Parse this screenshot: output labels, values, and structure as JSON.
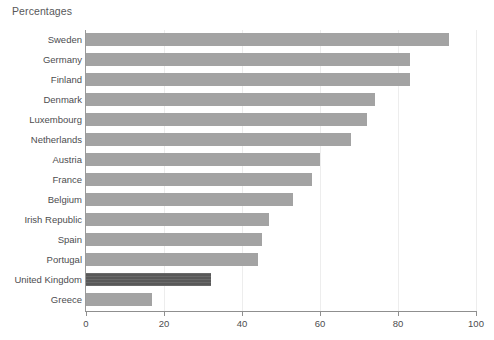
{
  "chart_data": {
    "type": "bar",
    "orientation": "horizontal",
    "title": "Percentages",
    "xlabel": "",
    "ylabel": "",
    "xlim": [
      0,
      100
    ],
    "xticks": [
      0,
      20,
      40,
      60,
      80,
      100
    ],
    "grid": true,
    "legend": null,
    "categories": [
      "Sweden",
      "Germany",
      "Finland",
      "Denmark",
      "Luxembourg",
      "Netherlands",
      "Austria",
      "France",
      "Belgium",
      "Irish Republic",
      "Spain",
      "Portugal",
      "United Kingdom",
      "Greece"
    ],
    "values": [
      93,
      83,
      83,
      74,
      72,
      68,
      60,
      58,
      53,
      47,
      45,
      44,
      32,
      17
    ],
    "highlight_category": "United Kingdom",
    "colors": {
      "bar": "#a3a3a3",
      "bar_highlight": "#595959",
      "gridline": "#ededed",
      "axis": "#8f8f8f",
      "text": "#4d4d4f",
      "background": "#ffffff"
    }
  }
}
